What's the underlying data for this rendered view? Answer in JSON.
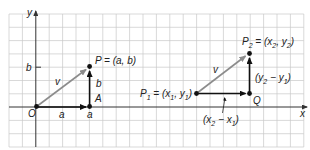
{
  "diagram": {
    "axes": {
      "x_label": "x",
      "y_label": "y"
    },
    "left": {
      "origin_label": "O",
      "point_P_label": "P = (a, b)",
      "point_A_label": "A",
      "vector_label": "v",
      "horizontal_label": "a",
      "vertical_label": "b",
      "x_tick_label": "a",
      "y_tick_label": "b"
    },
    "right": {
      "P1_label": "P",
      "P1_sub": "1",
      "P1_eq": " = (x",
      "P1_x_sub": "1",
      "P1_mid": ", y",
      "P1_y_sub": "1",
      "P1_end": ")",
      "P2_label": "P",
      "P2_sub": "2",
      "P2_eq": " = (x",
      "P2_x_sub": "2",
      "P2_mid": ", y",
      "P2_y_sub": "2",
      "P2_end": ")",
      "Q_label": "Q",
      "vector_label": "v",
      "dy_open": "(y",
      "dy_sub2": "2",
      "dy_mid": " − y",
      "dy_sub1": "1",
      "dy_close": ")",
      "dx_open": "(x",
      "dx_sub2": "2",
      "dx_mid": " − x",
      "dx_sub1": "1",
      "dx_close": ")"
    },
    "colors": {
      "grid": "#c8c8c8",
      "vector_v": "#8c8c8c",
      "vector_components": "#111111"
    }
  }
}
